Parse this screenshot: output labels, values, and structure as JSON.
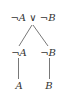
{
  "diagram": {
    "type": "tableau-tree",
    "nodes": {
      "root": "¬A ∨ ¬B",
      "left_mid": "¬A",
      "right_mid": "¬B",
      "left_leaf": "A",
      "right_leaf": "B"
    },
    "edges": [
      [
        "root",
        "left_mid"
      ],
      [
        "root",
        "right_mid"
      ],
      [
        "left_mid",
        "left_leaf"
      ],
      [
        "right_mid",
        "right_leaf"
      ]
    ],
    "colors": {
      "text": "#333333",
      "line": "#555555",
      "background": "#ffffff"
    }
  }
}
